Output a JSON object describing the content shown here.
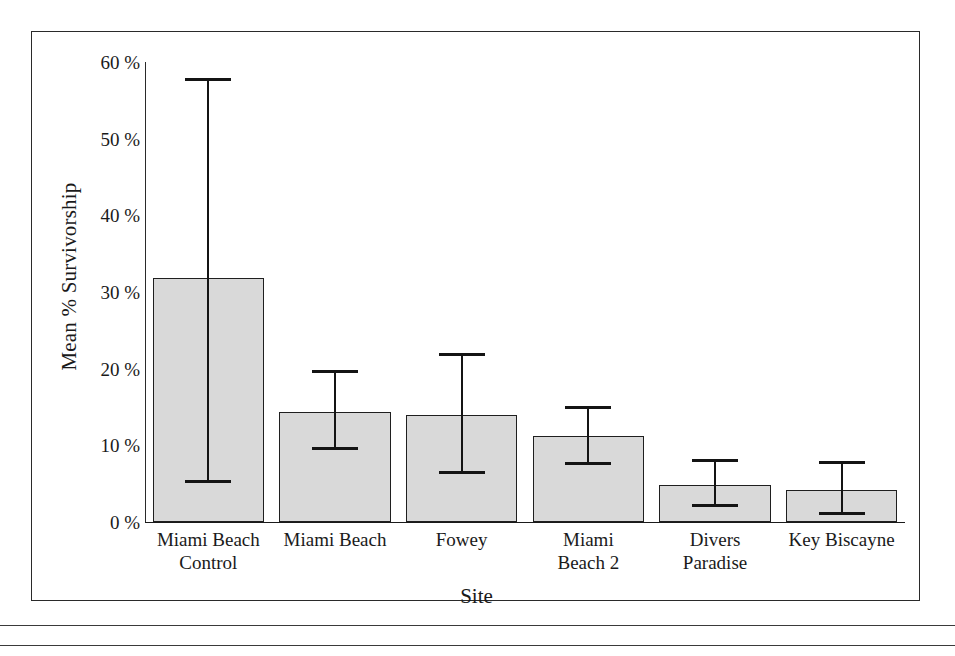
{
  "chart_data": {
    "type": "bar",
    "title": "",
    "subtitle": "",
    "xlabel": "Site",
    "ylabel": "Mean % Survivorship",
    "categories": [
      "Miami Beach Control",
      "Miami Beach",
      "Fowey",
      "Miami Beach 2",
      "Divers Paradise",
      "Key Biscayne"
    ],
    "category_lines": [
      [
        "Miami Beach",
        "Control"
      ],
      [
        "Miami Beach"
      ],
      [
        "Fowey"
      ],
      [
        "Miami",
        "Beach 2"
      ],
      [
        "Divers",
        "Paradise"
      ],
      [
        "Key Biscayne"
      ]
    ],
    "values": [
      31.8,
      14.3,
      14.0,
      11.2,
      4.8,
      4.2
    ],
    "error_upper": [
      57.5,
      19.4,
      21.6,
      14.8,
      7.8,
      7.6
    ],
    "error_lower": [
      5.1,
      9.4,
      6.3,
      7.4,
      2.0,
      0.9
    ],
    "ylim": [
      0,
      60
    ],
    "yticks": [
      0,
      10,
      20,
      30,
      40,
      50,
      60
    ],
    "ytick_labels": [
      "0 %",
      "10 %",
      "20 %",
      "30 %",
      "40 %",
      "50 %",
      "60 %"
    ],
    "grid": false,
    "legend": null,
    "legend_position": "none",
    "series": [
      {
        "name": "Mean % Survivorship",
        "values": [
          31.8,
          14.3,
          14.0,
          11.2,
          4.8,
          4.2
        ],
        "error_upper": [
          57.5,
          19.4,
          21.6,
          14.8,
          7.8,
          7.6
        ],
        "error_lower": [
          5.1,
          9.4,
          6.3,
          7.4,
          2.0,
          0.9
        ]
      }
    ]
  },
  "colors": {
    "bar_fill": "#d9d9d9",
    "bar_stroke": "#1f1f1f",
    "axis": "#1a1a1a",
    "error_bar": "#141414",
    "frame": "#2a2a2a",
    "text": "#1a1a1a",
    "background": "#ffffff"
  }
}
